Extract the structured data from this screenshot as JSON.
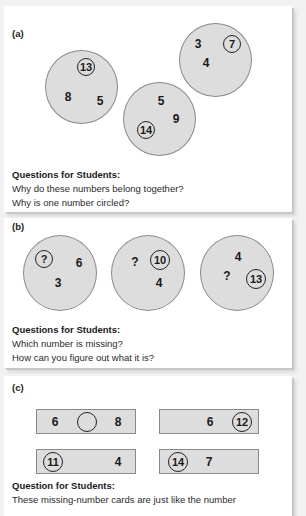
{
  "panel_a": {
    "label": "(a)",
    "circles": [
      {
        "numbers": [
          "13",
          "8",
          "5"
        ],
        "circled": "13"
      },
      {
        "numbers": [
          "5",
          "9",
          "14"
        ],
        "circled": "14"
      },
      {
        "numbers": [
          "3",
          "7",
          "4"
        ],
        "circled": "7"
      }
    ],
    "questions_title": "Questions for Students:",
    "questions": [
      "Why do these numbers belong together?",
      "Why is one number circled?"
    ]
  },
  "panel_b": {
    "label": "(b)",
    "circles": [
      {
        "numbers": [
          "?",
          "6",
          "3"
        ],
        "circled": "?"
      },
      {
        "numbers": [
          "?",
          "10",
          "4"
        ],
        "circled": "10"
      },
      {
        "numbers": [
          "4",
          "?",
          "13"
        ],
        "circled": "13"
      }
    ],
    "questions_title": "Questions for Students:",
    "questions": [
      "Which number is missing?",
      "How can you figure out what it is?"
    ]
  },
  "panel_c": {
    "label": "(c)",
    "cards": [
      {
        "left": "6",
        "circled": "",
        "right": "8"
      },
      {
        "left": "6",
        "circled": "12",
        "right": ""
      },
      {
        "left": "",
        "circled": "11",
        "right": "4"
      },
      {
        "left": "",
        "circled": "14",
        "right": "7"
      }
    ],
    "questions_title": "Question for Students:",
    "questions": [
      "These missing-number cards are just like the number"
    ]
  },
  "colors": {
    "shape_fill": "#dddddd",
    "shape_border": "#8a8a8a",
    "background": "#f1f1f1"
  }
}
